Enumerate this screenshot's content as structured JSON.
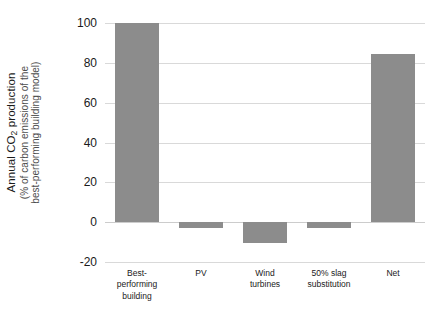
{
  "chart_data": {
    "type": "bar",
    "title": "",
    "xlabel": "",
    "ylabel": "Annual CO2 production (% of carbon emissions of the best-performing building model)",
    "ylabel_line1": "Annual CO",
    "ylabel_line1_sub": "2",
    "ylabel_line1_rest": " production",
    "ylabel_line2": "(% of carbon emissions of the",
    "ylabel_line3": "best-performing building model)",
    "categories": [
      "Best-\nperforming\nbuilding",
      "PV",
      "Wind\nturbines",
      "50% slag\nsubstitution",
      "Net"
    ],
    "categories_plain": [
      "Best-performing building",
      "PV",
      "Wind turbines",
      "50% slag substitution",
      "Net"
    ],
    "values": [
      100,
      -3,
      -10.5,
      -3,
      84.5
    ],
    "ylim": [
      -20,
      100
    ],
    "yticks": [
      100,
      80,
      60,
      40,
      20,
      0,
      -20
    ],
    "ytick_labels": [
      "100",
      "80",
      "60",
      "40",
      "20",
      "0",
      "-20"
    ],
    "grid": true,
    "legend": null,
    "bar_color": "#8c8c8c",
    "gridline_color": "#d9d9d9",
    "background_color": "#ffffff",
    "text_color": "#1a1a1a"
  }
}
